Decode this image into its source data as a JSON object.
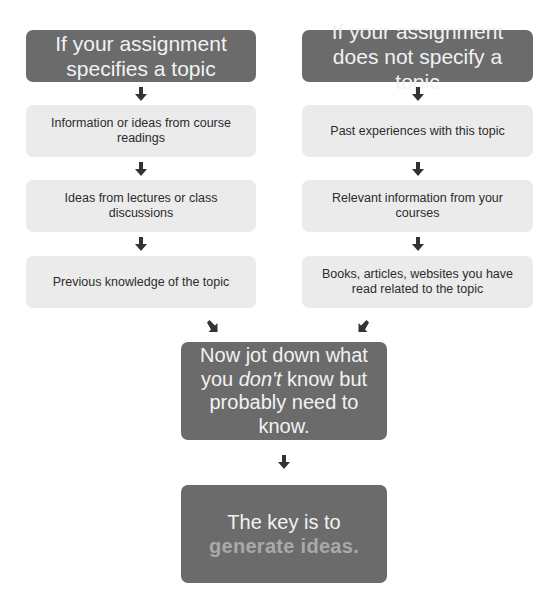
{
  "left_column": {
    "header": "If your assignment specifies a topic",
    "items": [
      "Information or ideas from course readings",
      "Ideas from lectures or class discussions",
      "Previous knowledge of the topic"
    ]
  },
  "right_column": {
    "header": "If your assignment does not specify a topic",
    "items": [
      "Past experiences with this topic",
      "Relevant information from your courses",
      "Books, articles, websites you have read related to the topic"
    ]
  },
  "middle_box": {
    "line1_prefix": "Now jot down what you ",
    "emphasis": "don't",
    "line1_suffix": " know but probably need to know."
  },
  "final_box": {
    "line1": "The key is to",
    "highlight": "generate ideas."
  },
  "colors": {
    "dark_box": "#6b6b6b",
    "light_box": "#ebebeb",
    "arrow": "#333333",
    "highlight_text": "#a9a9a9"
  },
  "icons": {
    "down_arrow": "arrow-down-icon",
    "diag_right": "arrow-down-right-icon",
    "diag_left": "arrow-down-left-icon"
  }
}
